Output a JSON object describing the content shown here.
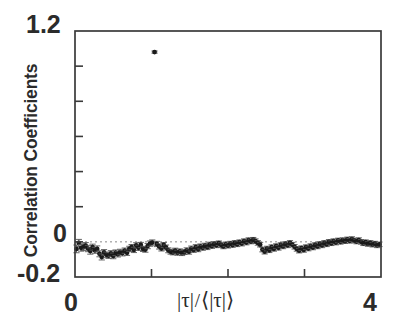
{
  "chart_data": {
    "type": "scatter",
    "title": "",
    "subtitle": "",
    "xlabel": "|τ|/⟨|τ|⟩",
    "ylabel": "Correlation Coefficients",
    "xlim": [
      0,
      4
    ],
    "ylim": [
      -0.2,
      1.2
    ],
    "xticks": [
      0,
      1,
      2,
      3,
      4
    ],
    "xticklabels": [
      "0",
      "",
      "",
      "",
      "4"
    ],
    "yticks": [
      -0.2,
      0.0,
      0.2,
      0.4,
      0.6,
      0.8,
      1.0,
      1.2
    ],
    "yticklabels": [
      "-0.2",
      "0",
      "",
      "",
      "",
      "",
      "",
      "1.2"
    ],
    "grid": false,
    "legend": null,
    "reference_lines": [
      {
        "axis": "y",
        "value": 0.0,
        "style": "dotted",
        "color": "#8a8a8a"
      }
    ],
    "marker": "filled-circle",
    "marker_color": "#1a1a1a",
    "errorbar_color": "#555555",
    "series": [
      {
        "name": "correlation coefficients",
        "x": [
          0.02,
          0.05,
          0.08,
          0.11,
          0.14,
          0.17,
          0.2,
          0.23,
          0.26,
          0.29,
          0.32,
          0.35,
          0.38,
          0.41,
          0.44,
          0.47,
          0.5,
          0.53,
          0.56,
          0.59,
          0.62,
          0.65,
          0.68,
          0.71,
          0.74,
          0.77,
          0.8,
          0.83,
          0.86,
          0.89,
          0.92,
          0.95,
          0.98,
          1.01,
          1.04,
          1.07,
          1.1,
          1.13,
          1.16,
          1.19,
          1.22,
          1.25,
          1.28,
          1.31,
          1.34,
          1.37,
          1.4,
          1.43,
          1.46,
          1.49,
          1.52,
          1.55,
          1.58,
          1.61,
          1.64,
          1.67,
          1.7,
          1.73,
          1.76,
          1.79,
          1.82,
          1.85,
          1.88,
          1.91,
          1.94,
          1.97,
          2.0,
          2.03,
          2.06,
          2.09,
          2.12,
          2.15,
          2.18,
          2.21,
          2.24,
          2.27,
          2.3,
          2.33,
          2.36,
          2.39,
          2.42,
          2.45,
          2.48,
          2.51,
          2.54,
          2.57,
          2.6,
          2.63,
          2.66,
          2.69,
          2.72,
          2.75,
          2.78,
          2.81,
          2.84,
          2.87,
          2.9,
          2.93,
          2.96,
          2.99,
          3.02,
          3.05,
          3.08,
          3.11,
          3.14,
          3.17,
          3.2,
          3.23,
          3.26,
          3.29,
          3.32,
          3.35,
          3.38,
          3.41,
          3.44,
          3.47,
          3.5,
          3.53,
          3.56,
          3.59,
          3.62,
          3.65,
          3.68,
          3.71,
          3.74,
          3.77,
          3.8,
          3.83,
          3.86,
          3.89,
          3.92,
          3.95,
          3.98
        ],
        "y": [
          -0.04,
          -0.006,
          -0.034,
          -0.03,
          -0.022,
          -0.038,
          -0.052,
          -0.03,
          -0.048,
          -0.04,
          -0.068,
          -0.086,
          -0.06,
          -0.074,
          -0.078,
          -0.066,
          -0.08,
          -0.062,
          -0.07,
          -0.058,
          -0.064,
          -0.05,
          -0.062,
          -0.04,
          -0.03,
          -0.046,
          -0.02,
          -0.034,
          -0.018,
          -0.04,
          -0.044,
          -0.024,
          -0.01,
          -0.004,
          1.08,
          -0.012,
          -0.026,
          -0.038,
          -0.018,
          -0.032,
          -0.048,
          -0.056,
          -0.06,
          -0.05,
          -0.062,
          -0.054,
          -0.064,
          -0.058,
          -0.048,
          -0.056,
          -0.038,
          -0.046,
          -0.03,
          -0.042,
          -0.026,
          -0.034,
          -0.022,
          -0.03,
          -0.016,
          -0.024,
          -0.012,
          -0.02,
          -0.008,
          -0.018,
          -0.026,
          -0.014,
          -0.022,
          -0.01,
          -0.018,
          -0.006,
          -0.014,
          -0.002,
          -0.01,
          0.004,
          -0.004,
          0.01,
          0.002,
          0.012,
          0.004,
          -0.006,
          -0.016,
          -0.044,
          -0.056,
          -0.038,
          -0.048,
          -0.03,
          -0.04,
          -0.024,
          -0.034,
          -0.018,
          -0.026,
          -0.012,
          -0.02,
          -0.006,
          -0.016,
          -0.028,
          -0.04,
          -0.05,
          -0.036,
          -0.046,
          -0.03,
          -0.038,
          -0.024,
          -0.032,
          -0.018,
          -0.026,
          -0.012,
          -0.02,
          -0.006,
          -0.014,
          0.0,
          -0.008,
          0.004,
          -0.004,
          0.008,
          0.0,
          0.01,
          0.004,
          0.014,
          0.006,
          0.016,
          0.008,
          0.002,
          0.01,
          0.0,
          -0.008,
          -0.002,
          -0.012,
          -0.006,
          -0.016,
          -0.01,
          -0.02,
          -0.014
        ],
        "yerr": [
          0.022,
          0.02,
          0.019,
          0.019,
          0.018,
          0.018,
          0.018,
          0.017,
          0.017,
          0.017,
          0.017,
          0.017,
          0.016,
          0.016,
          0.016,
          0.016,
          0.016,
          0.016,
          0.016,
          0.016,
          0.016,
          0.015,
          0.015,
          0.015,
          0.015,
          0.015,
          0.015,
          0.015,
          0.015,
          0.015,
          0.015,
          0.015,
          0.015,
          0.015,
          0.006,
          0.015,
          0.015,
          0.014,
          0.014,
          0.014,
          0.014,
          0.014,
          0.014,
          0.014,
          0.014,
          0.014,
          0.014,
          0.014,
          0.014,
          0.014,
          0.014,
          0.014,
          0.014,
          0.014,
          0.014,
          0.014,
          0.014,
          0.014,
          0.014,
          0.013,
          0.013,
          0.013,
          0.013,
          0.013,
          0.013,
          0.013,
          0.013,
          0.013,
          0.013,
          0.013,
          0.013,
          0.013,
          0.013,
          0.013,
          0.013,
          0.013,
          0.013,
          0.013,
          0.013,
          0.013,
          0.013,
          0.013,
          0.013,
          0.013,
          0.013,
          0.013,
          0.013,
          0.013,
          0.013,
          0.013,
          0.013,
          0.013,
          0.013,
          0.013,
          0.013,
          0.013,
          0.013,
          0.013,
          0.013,
          0.013,
          0.013,
          0.013,
          0.013,
          0.013,
          0.013,
          0.013,
          0.013,
          0.013,
          0.013,
          0.013,
          0.013,
          0.013,
          0.013,
          0.013,
          0.013,
          0.013,
          0.013,
          0.013,
          0.013,
          0.013,
          0.013,
          0.013,
          0.013,
          0.013,
          0.013,
          0.013,
          0.013,
          0.013,
          0.013,
          0.013,
          0.013,
          0.013,
          0.013
        ]
      }
    ]
  },
  "axis_labels": {
    "y_top": "1.2",
    "y_zero": "0",
    "y_bottom": "-0.2",
    "x_left": "0",
    "x_right": "4",
    "y_title": "Correlation Coefficients",
    "x_title_num": "|τ|",
    "x_title_slash": "/",
    "x_title_den": "⟨|τ|⟩"
  },
  "style": {
    "frame_color": "#3a3a3a",
    "background": "#ffffff",
    "text_color": "#2b2b2b"
  }
}
